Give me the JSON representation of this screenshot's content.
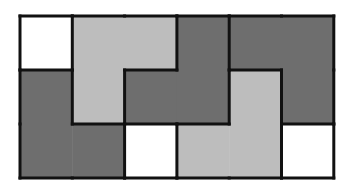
{
  "puzzle": {
    "title": "",
    "rows": 3,
    "cols": 6,
    "origin": {
      "x": 20,
      "y": 16
    },
    "cell": {
      "w": 52.3,
      "h": 54
    },
    "colors": {
      "white": "#ffffff",
      "light": "#bdbdbd",
      "dark": "#6e6e6e",
      "border": "#111111"
    },
    "cells": [
      [
        "E",
        "L1",
        "L1",
        "D1",
        "D2",
        "D2"
      ],
      [
        "D3",
        "L1",
        "D1",
        "D1",
        "L2",
        "D2"
      ],
      [
        "D3",
        "D3",
        "E",
        "L2",
        "L2",
        "E"
      ]
    ],
    "pieces": [
      {
        "id": "E",
        "name": "empty-cell",
        "shade": "white"
      },
      {
        "id": "L1",
        "name": "light-piece-left",
        "shade": "light"
      },
      {
        "id": "L2",
        "name": "light-piece-right",
        "shade": "light"
      },
      {
        "id": "D1",
        "name": "dark-piece-center",
        "shade": "dark"
      },
      {
        "id": "D2",
        "name": "dark-piece-right",
        "shade": "dark"
      },
      {
        "id": "D3",
        "name": "dark-piece-left",
        "shade": "dark"
      }
    ]
  }
}
